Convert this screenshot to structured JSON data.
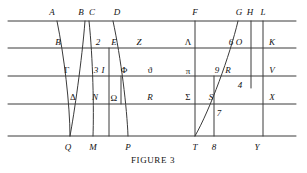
{
  "figure": {
    "caption": "FIGURE 3",
    "caption_x": 153,
    "caption_y": 160,
    "width": 307,
    "height": 173,
    "stroke_color": "#3a3a3a",
    "text_color": "#111111",
    "background": "#ffffff"
  },
  "chart_data": {
    "type": "diagram",
    "title": "FIGURE 3",
    "horizontal_lines": [
      {
        "name": "line-top",
        "y": 21,
        "x1": 8,
        "x2": 296
      },
      {
        "name": "line-2",
        "y": 48,
        "x1": 8,
        "x2": 296
      },
      {
        "name": "line-3",
        "y": 76,
        "x1": 8,
        "x2": 296
      },
      {
        "name": "line-4",
        "y": 104,
        "x1": 8,
        "x2": 296
      },
      {
        "name": "line-bottom",
        "y": 136,
        "x1": 8,
        "x2": 296
      }
    ],
    "labels": [
      {
        "id": "A",
        "text": "A",
        "x": 52,
        "y": 12,
        "style": "italic"
      },
      {
        "id": "B-top",
        "text": "B",
        "x": 81,
        "y": 12,
        "style": "italic"
      },
      {
        "id": "C",
        "text": "C",
        "x": 92,
        "y": 12,
        "style": "italic"
      },
      {
        "id": "D",
        "text": "D",
        "x": 117,
        "y": 12,
        "style": "italic"
      },
      {
        "id": "F",
        "text": "F",
        "x": 195,
        "y": 12,
        "style": "italic"
      },
      {
        "id": "G",
        "text": "G",
        "x": 239,
        "y": 12,
        "style": "italic"
      },
      {
        "id": "H",
        "text": "H",
        "x": 250,
        "y": 12,
        "style": "italic"
      },
      {
        "id": "L",
        "text": "L",
        "x": 263,
        "y": 12,
        "style": "italic"
      },
      {
        "id": "B-row2",
        "text": "B",
        "x": 58,
        "y": 42,
        "style": "italic"
      },
      {
        "id": "two",
        "text": "2",
        "x": 98,
        "y": 42,
        "style": "italic"
      },
      {
        "id": "E",
        "text": "E",
        "x": 114,
        "y": 42,
        "style": "italic"
      },
      {
        "id": "Z",
        "text": "Z",
        "x": 139,
        "y": 42,
        "style": "italic"
      },
      {
        "id": "Lambda",
        "text": "Λ",
        "x": 188,
        "y": 42,
        "style": "upright"
      },
      {
        "id": "six",
        "text": "6",
        "x": 231,
        "y": 42,
        "style": "italic"
      },
      {
        "id": "O",
        "text": "O",
        "x": 239,
        "y": 42,
        "style": "italic"
      },
      {
        "id": "K",
        "text": "K",
        "x": 272,
        "y": 42,
        "style": "italic"
      },
      {
        "id": "Gamma",
        "text": "Γ",
        "x": 67,
        "y": 70,
        "style": "upright"
      },
      {
        "id": "three",
        "text": "3",
        "x": 96,
        "y": 70,
        "style": "italic"
      },
      {
        "id": "I",
        "text": "I",
        "x": 103,
        "y": 70,
        "style": "italic"
      },
      {
        "id": "Phi",
        "text": "Φ",
        "x": 124,
        "y": 70,
        "style": "upright"
      },
      {
        "id": "theta",
        "text": "ϑ",
        "x": 150,
        "y": 70,
        "style": "upright"
      },
      {
        "id": "pi",
        "text": "π",
        "x": 188,
        "y": 71,
        "style": "upright"
      },
      {
        "id": "nine",
        "text": "9",
        "x": 217,
        "y": 70,
        "style": "italic"
      },
      {
        "id": "R-row3",
        "text": "R",
        "x": 228,
        "y": 70,
        "style": "italic"
      },
      {
        "id": "V",
        "text": "V",
        "x": 272,
        "y": 70,
        "style": "italic"
      },
      {
        "id": "four",
        "text": "4",
        "x": 240,
        "y": 85,
        "style": "italic"
      },
      {
        "id": "Delta",
        "text": "Δ",
        "x": 73,
        "y": 97,
        "style": "upright"
      },
      {
        "id": "N",
        "text": "N",
        "x": 95,
        "y": 97,
        "style": "italic"
      },
      {
        "id": "Omega",
        "text": "Ω",
        "x": 114,
        "y": 98,
        "style": "upright"
      },
      {
        "id": "R-row4",
        "text": "R",
        "x": 150,
        "y": 97,
        "style": "italic"
      },
      {
        "id": "Sigma",
        "text": "Σ",
        "x": 188,
        "y": 97,
        "style": "upright"
      },
      {
        "id": "S",
        "text": "S",
        "x": 211,
        "y": 97,
        "style": "italic"
      },
      {
        "id": "X",
        "text": "X",
        "x": 272,
        "y": 97,
        "style": "italic"
      },
      {
        "id": "seven",
        "text": "7",
        "x": 219,
        "y": 113,
        "style": "italic"
      },
      {
        "id": "Q",
        "text": "Q",
        "x": 68,
        "y": 147,
        "style": "italic"
      },
      {
        "id": "M",
        "text": "M",
        "x": 93,
        "y": 147,
        "style": "italic"
      },
      {
        "id": "P",
        "text": "P",
        "x": 128,
        "y": 147,
        "style": "italic"
      },
      {
        "id": "T",
        "text": "T",
        "x": 195,
        "y": 147,
        "style": "italic"
      },
      {
        "id": "eight",
        "text": "8",
        "x": 214,
        "y": 147,
        "style": "italic"
      },
      {
        "id": "Y",
        "text": "Y",
        "x": 257,
        "y": 147,
        "style": "italic"
      }
    ],
    "curves": [
      {
        "name": "curve-A-Q",
        "from": "A",
        "to": "Q"
      },
      {
        "name": "curve-B-Q",
        "from": "B",
        "to": "Q"
      },
      {
        "name": "curve-C-M",
        "from": "C",
        "to": "M"
      },
      {
        "name": "curve-D-P",
        "from": "D",
        "to": "P"
      },
      {
        "name": "curve-G-T",
        "from": "G",
        "to": "T"
      }
    ],
    "verticals": [
      {
        "name": "vertical-F-T",
        "x": 195,
        "y1": 21,
        "y2": 136
      },
      {
        "name": "vertical-L-Y",
        "x": 263,
        "y1": 21,
        "y2": 136
      },
      {
        "name": "vertical-H-4",
        "x": 251,
        "y1": 21,
        "y2": 88
      },
      {
        "name": "vertical-9-8",
        "x": 214,
        "y1": 76,
        "y2": 136
      },
      {
        "name": "vertical-omega",
        "x": 121,
        "y1": 76,
        "y2": 104
      },
      {
        "name": "vertical-E-M",
        "x": 109,
        "y1": 48,
        "y2": 136
      }
    ]
  }
}
